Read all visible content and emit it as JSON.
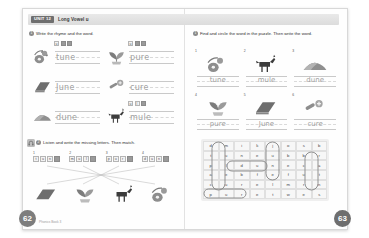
{
  "header": {
    "unit_badge": "UNIT 12",
    "title": "Long Vowel u"
  },
  "colors": {
    "banner_bg": "#e4e4e4",
    "badge_bg": "#6f6f6f",
    "pencil_gray": "#9e9e9e",
    "page_circle": "#7d7d7d"
  },
  "left_page": {
    "page_number": "62",
    "footer": "Phonics Book 3",
    "exercise1": {
      "number": "1",
      "instruction": "Write the rhyme and the word.",
      "items": [
        {
          "tiles": [
            "u",
            "",
            "e"
          ],
          "word": "tune",
          "picture": "guitar-icon"
        },
        {
          "tiles": [
            "u",
            "r",
            "e"
          ],
          "word": "pure",
          "picture": "plant-icon"
        },
        {
          "tiles": [
            "",
            "",
            ""
          ],
          "word": "June",
          "picture": "calendar-icon"
        },
        {
          "tiles": [
            "",
            "",
            ""
          ],
          "word": "cure",
          "picture": "medicine-icon"
        },
        {
          "tiles": [
            "",
            "",
            ""
          ],
          "word": "dune",
          "picture": "dune-icon"
        },
        {
          "tiles": [
            "u",
            "l",
            "e"
          ],
          "word": "mule",
          "picture": "mule-icon"
        }
      ]
    },
    "exercise3": {
      "number": "2",
      "instruction": "Listen and write the missing letters. Then match.",
      "items": [
        {
          "number": "1",
          "tiles": [
            "t",
            "u",
            "n",
            "e"
          ]
        },
        {
          "number": "2",
          "tiles": [
            "m",
            "u",
            "l",
            "e"
          ]
        },
        {
          "number": "3",
          "tiles": [
            "p",
            "u",
            "r",
            "e"
          ]
        },
        {
          "number": "4",
          "tiles": [
            "d",
            "u",
            "n",
            "e"
          ]
        }
      ],
      "pictures": [
        "calendar-icon",
        "plant-icon",
        "mule-icon",
        "guitar-icon"
      ]
    }
  },
  "right_page": {
    "page_number": "63",
    "exercise2": {
      "number": "1",
      "instruction": "Find and circle the word in the puzzle. Then write the word.",
      "items": [
        {
          "number": "1",
          "word": "tune",
          "picture": "guitar-icon"
        },
        {
          "number": "2",
          "word": "mule",
          "picture": "mule-icon"
        },
        {
          "number": "3",
          "word": "dune",
          "picture": "dune-icon"
        },
        {
          "number": "4",
          "word": "pure",
          "picture": "plant-icon"
        },
        {
          "number": "5",
          "word": "June",
          "picture": "calendar-icon"
        },
        {
          "number": "6",
          "word": "cure",
          "picture": "medicine-icon"
        }
      ]
    },
    "puzzle": {
      "rows": [
        [
          "d",
          "m",
          "i",
          "k",
          "j",
          "o",
          "s",
          "b"
        ],
        [
          "t",
          "u",
          "n",
          "e",
          "u",
          "b",
          "b",
          "r"
        ],
        [
          "p",
          "l",
          "d",
          "u",
          "n",
          "e",
          "c",
          "a"
        ],
        [
          "a",
          "e",
          "b",
          "f",
          "e",
          "f",
          "u",
          "t"
        ],
        [
          "c",
          "u",
          "r",
          "e",
          "l",
          "m",
          "r",
          "n"
        ],
        [
          "p",
          "u",
          "r",
          "e",
          "t",
          "w",
          "e",
          "s"
        ]
      ],
      "found_words": [
        "tune",
        "mule",
        "dune",
        "June",
        "cure",
        "pure"
      ]
    }
  }
}
